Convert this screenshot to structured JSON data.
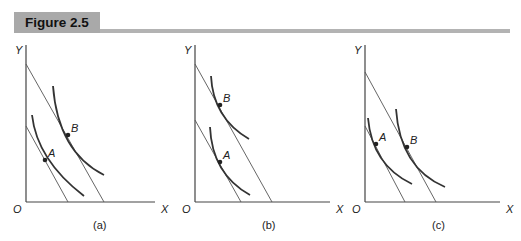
{
  "figure": {
    "title": "Figure 2.5"
  },
  "colors": {
    "header_bg": "#a9a9a9",
    "rule": "#b3b3b3",
    "line": "#444444",
    "curve": "#333333"
  },
  "panels": [
    {
      "id": "a",
      "caption": "(a)",
      "y_label": "Y",
      "x_label": "X",
      "origin_label": "O",
      "points": [
        {
          "label": "A",
          "x": 45,
          "y": 160
        },
        {
          "label": "B",
          "x": 68,
          "y": 135
        }
      ],
      "budget_lines": [
        {
          "x1": 26,
          "y1": 126,
          "x2": 68,
          "y2": 202
        },
        {
          "x1": 26,
          "y1": 64,
          "x2": 104,
          "y2": 202
        }
      ],
      "indifference_curves": [
        "M32,115 Q37,160 84,196",
        "M53,86 Q58,152 104,175"
      ]
    },
    {
      "id": "b",
      "caption": "(b)",
      "y_label": "Y",
      "x_label": "X",
      "origin_label": "O",
      "points": [
        {
          "label": "A",
          "x": 220,
          "y": 162
        },
        {
          "label": "B",
          "x": 220,
          "y": 105
        }
      ],
      "budget_lines": [
        {
          "x1": 195,
          "y1": 120,
          "x2": 241,
          "y2": 202
        },
        {
          "x1": 195,
          "y1": 64,
          "x2": 272,
          "y2": 202
        }
      ],
      "indifference_curves": [
        "M210,127 Q212,174 250,195",
        "M211,76 Q213,118 249,139"
      ]
    },
    {
      "id": "c",
      "caption": "(c)",
      "y_label": "Y",
      "x_label": "X",
      "origin_label": "O",
      "points": [
        {
          "label": "A",
          "x": 376,
          "y": 144
        },
        {
          "label": "B",
          "x": 407,
          "y": 147
        }
      ],
      "budget_lines": [
        {
          "x1": 365,
          "y1": 126,
          "x2": 405,
          "y2": 202
        },
        {
          "x1": 365,
          "y1": 72,
          "x2": 436,
          "y2": 202
        }
      ],
      "indifference_curves": [
        "M368,118 Q372,165 412,184",
        "M396,109 Q400,168 445,187"
      ]
    }
  ]
}
